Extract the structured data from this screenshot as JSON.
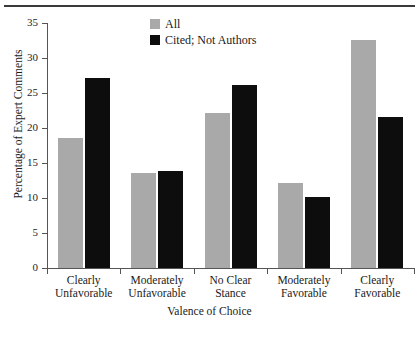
{
  "chart_data": {
    "type": "bar",
    "title": "",
    "xlabel": "Valence of Choice",
    "ylabel": "Percentage of Expert Comments",
    "ylim": [
      0,
      35
    ],
    "yticks": [
      0,
      5,
      10,
      15,
      20,
      25,
      30,
      35
    ],
    "grid": false,
    "legend_position": "top-center",
    "categories": [
      "Clearly Unfavorable",
      "Moderately Unfavorable",
      "No Clear Stance",
      "Moderately Favorable",
      "Clearly Favorable"
    ],
    "category_lines": [
      [
        "Clearly",
        "Unfavorable"
      ],
      [
        "Moderately",
        "Unfavorable"
      ],
      [
        "No Clear",
        "Stance"
      ],
      [
        "Moderately",
        "Favorable"
      ],
      [
        "Clearly",
        "Favorable"
      ]
    ],
    "series": [
      {
        "name": "All",
        "color": "#a9a9a9",
        "values": [
          18.6,
          13.6,
          22.2,
          12.1,
          32.6
        ]
      },
      {
        "name": "Cited; Not Authors",
        "color": "#0d0d0d",
        "values": [
          27.2,
          13.9,
          26.1,
          10.1,
          21.6
        ]
      }
    ]
  },
  "legend": {
    "items": [
      {
        "label": "All",
        "swatch": "gray-swatch-icon"
      },
      {
        "label": "Cited; Not Authors",
        "swatch": "black-swatch-icon"
      }
    ]
  },
  "axis": {
    "y_tick_labels": [
      "35",
      "30",
      "25",
      "20",
      "15",
      "10",
      "5",
      "0"
    ],
    "y_title": "Percentage of Expert Comments",
    "x_title": "Valence of Choice"
  }
}
